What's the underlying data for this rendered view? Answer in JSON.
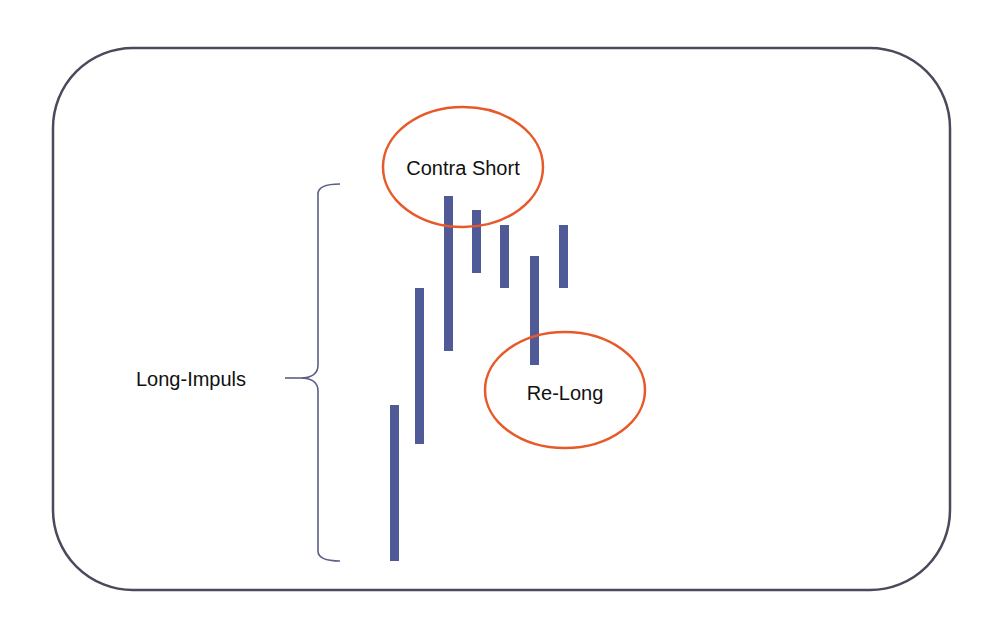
{
  "diagram": {
    "frame": {
      "x": 53,
      "y": 48,
      "width": 897,
      "height": 542,
      "radius": 80,
      "stroke": "#4a4a5a"
    },
    "bar_color": "#4f5a96",
    "ellipse_color": "#e8592a",
    "bracket_color": "#5a5f86",
    "bars": [
      {
        "x": 395,
        "top": 405,
        "bottom": 561
      },
      {
        "x": 420,
        "top": 288,
        "bottom": 444
      },
      {
        "x": 449,
        "top": 196,
        "bottom": 351
      },
      {
        "x": 477,
        "top": 210,
        "bottom": 273
      },
      {
        "x": 505,
        "top": 225,
        "bottom": 288
      },
      {
        "x": 535,
        "top": 256,
        "bottom": 365
      },
      {
        "x": 563,
        "top": 225,
        "bottom": 288
      }
    ],
    "labels": {
      "contra_short": "Contra Short",
      "re_long": "Re-Long",
      "long_impuls": "Long-Impuls"
    }
  }
}
